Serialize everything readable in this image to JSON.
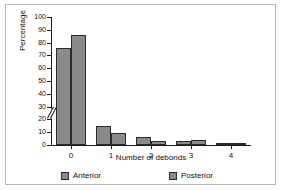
{
  "chart_data": {
    "type": "bar",
    "title": "",
    "xlabel": "Number of debonds",
    "ylabel": "Percentage",
    "categories": [
      "0",
      "1",
      "2",
      "3",
      "4"
    ],
    "series": [
      {
        "name": "Anterior",
        "color": "#8a8a8a",
        "values": [
          76,
          15,
          6,
          3,
          1
        ]
      },
      {
        "name": "Posterior",
        "color": "#8a8a8a",
        "values": [
          86,
          9,
          3,
          4,
          1
        ]
      }
    ],
    "ylim": [
      0,
      100
    ],
    "yticks": [
      0,
      10,
      20,
      30,
      40,
      50,
      60,
      70,
      80,
      90,
      100
    ],
    "ytick_labels": [
      "0",
      "10",
      "20",
      "30",
      "40",
      "50",
      "60",
      "70",
      "80",
      "90",
      "100"
    ],
    "axis_break": {
      "present": true,
      "between": [
        20,
        30
      ],
      "icon": "axis-break-slashes"
    },
    "grid": false,
    "legend_position": "bottom",
    "bar_border_color": "#2b2b2b",
    "axis_color": "#1a1a1a",
    "background_color": "#ffffff"
  }
}
